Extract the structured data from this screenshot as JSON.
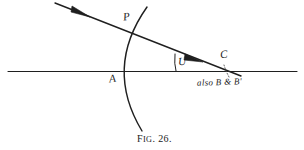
{
  "figure": {
    "caption_prefix": "F",
    "caption_smallcaps": "IG",
    "caption_number": ". 26.",
    "caption_full": "Fig. 26.",
    "background_color": "#ffffff",
    "ink_color": "#1a1a1a"
  },
  "labels": {
    "point_P": "P",
    "point_A": "A",
    "angle_U": "U",
    "point_C": "C",
    "note_also": "also B & B'"
  },
  "geometry": {
    "horizontal_line": {
      "x1": 8,
      "y1": 71,
      "x2": 297,
      "y2": 71,
      "name": "axis-line"
    },
    "incident_ray": {
      "x1": 55,
      "y1": 3,
      "x2": 240,
      "y2": 76,
      "name": "ray-line"
    },
    "ray_arrow_1": {
      "x": 85,
      "y": 14
    },
    "ray_arrow_2": {
      "x": 198,
      "y": 59
    },
    "arc": {
      "top_x": 147,
      "top_y": 7,
      "mid_x": 114,
      "mid_y": 71,
      "bottom_x": 142,
      "bottom_y": 131
    },
    "angle_arc": {
      "center_x": 176,
      "center_y": 71,
      "radius": 18
    },
    "leader_dots": {
      "x1": 228,
      "y1": 78,
      "x2": 223,
      "y2": 62
    },
    "intersection_P": {
      "x": 134,
      "y": 31
    },
    "intersection_A": {
      "x": 115,
      "y": 71
    },
    "point_C_pos": {
      "x": 222,
      "y": 71
    }
  }
}
